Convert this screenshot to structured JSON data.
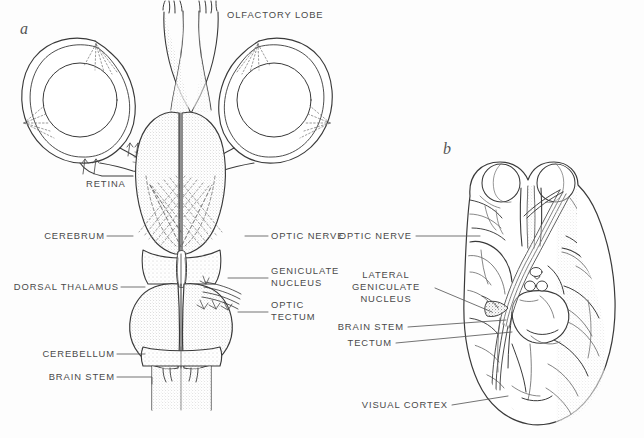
{
  "figure": {
    "background": "#fdfdfd",
    "ink": "#3a3a3a",
    "label_color": "#4a4a4a",
    "panels": [
      {
        "key": "a",
        "letter": "a"
      },
      {
        "key": "b",
        "letter": "b"
      }
    ]
  },
  "panel_a": {
    "letter": "a",
    "labels": {
      "olfactory_lobe": "OLFACTORY LOBE",
      "retina": "RETINA",
      "cerebrum": "CEREBRUM",
      "dorsal_thalamus": "DORSAL THALAMUS",
      "cerebellum": "CEREBELLUM",
      "brain_stem": "BRAIN STEM",
      "optic_nerve": "OPTIC NERVE",
      "geniculate_nucleus_line1": "GENICULATE",
      "geniculate_nucleus_line2": "NUCLEUS",
      "optic_tectum_line1": "OPTIC",
      "optic_tectum_line2": "TECTUM"
    }
  },
  "panel_b": {
    "letter": "b",
    "labels": {
      "optic_nerve": "OPTIC NERVE",
      "lateral_geniculate_line1": "LATERAL",
      "lateral_geniculate_line2": "GENICULATE",
      "lateral_geniculate_line3": "NUCLEUS",
      "brain_stem": "BRAIN STEM",
      "tectum": "TECTUM",
      "visual_cortex": "VISUAL CORTEX"
    }
  }
}
